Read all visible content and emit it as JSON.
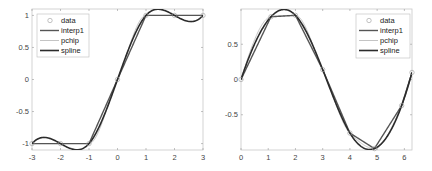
{
  "chart_data": [
    {
      "type": "line",
      "title": "",
      "xlabel": "",
      "ylabel": "",
      "xlim": [
        -3,
        3
      ],
      "ylim": [
        -1.1,
        1.1
      ],
      "grid": false,
      "legend_position": "upper left",
      "xticks": [
        "-3",
        "-2",
        "-1",
        "0",
        "1",
        "2",
        "3"
      ],
      "yticks": [
        "1",
        "0.5",
        "0",
        "-0.5",
        "-1"
      ],
      "x": [
        -3,
        -2,
        -1,
        0,
        1,
        2,
        3
      ],
      "y": [
        -1,
        -1,
        -1,
        0,
        1,
        1,
        1
      ],
      "series": [
        {
          "name": "data",
          "style": "markers",
          "color": "#9a9a9a"
        },
        {
          "name": "interp1",
          "style": "line",
          "color": "#555555"
        },
        {
          "name": "pchip",
          "style": "line",
          "color": "#c4c4c4"
        },
        {
          "name": "spline",
          "style": "line",
          "color": "#2b2b2b"
        }
      ]
    },
    {
      "type": "line",
      "title": "",
      "xlabel": "",
      "ylabel": "",
      "xlim": [
        0,
        6.28
      ],
      "ylim": [
        -1,
        1
      ],
      "grid": false,
      "legend_position": "upper right",
      "xticks": [
        "0",
        "1",
        "2",
        "3",
        "4",
        "5",
        "6"
      ],
      "yticks": [
        "0.5",
        "0",
        "-0.5"
      ],
      "x": [
        0,
        1.1,
        2.0,
        3.0,
        4.0,
        4.9,
        5.9,
        6.28
      ],
      "y": [
        0,
        0.89,
        0.91,
        0.14,
        -0.76,
        -0.98,
        -0.37,
        0.1
      ],
      "series": [
        {
          "name": "data",
          "style": "markers",
          "color": "#9a9a9a"
        },
        {
          "name": "interp1",
          "style": "line",
          "color": "#555555"
        },
        {
          "name": "pchip",
          "style": "line",
          "color": "#c4c4c4"
        },
        {
          "name": "spline",
          "style": "line",
          "color": "#2b2b2b"
        }
      ]
    }
  ],
  "plots": [
    {
      "legend": {
        "data": "data",
        "interp1": "interp1",
        "pchip": "pchip",
        "spline": "spline"
      }
    },
    {
      "legend": {
        "data": "data",
        "interp1": "interp1",
        "pchip": "pchip",
        "spline": "spline"
      }
    }
  ]
}
